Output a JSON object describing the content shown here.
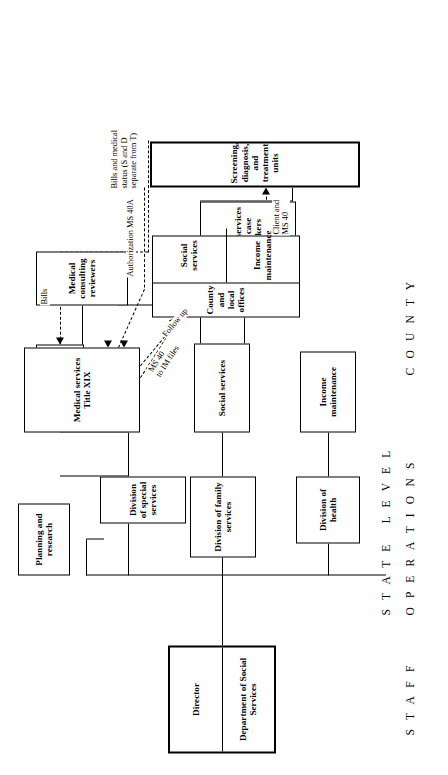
{
  "diagram": {
    "swimlanes": [
      {
        "id": "staff",
        "label": "S T A F F"
      },
      {
        "id": "operations",
        "label": "O P E R A T I O N S"
      },
      {
        "id": "state_level",
        "label": "S T A T E   L E V E L"
      },
      {
        "id": "county",
        "label": "C O U N T Y"
      }
    ],
    "boxes": [
      {
        "id": "director",
        "lines": [
          "Director",
          "Department of Social Services"
        ]
      },
      {
        "id": "planning",
        "lines": [
          "Planning and research"
        ]
      },
      {
        "id": "finance",
        "lines": [
          "Finance"
        ]
      },
      {
        "id": "div_special",
        "lines": [
          "Division of special services"
        ]
      },
      {
        "id": "div_family",
        "lines": [
          "Division of family services"
        ]
      },
      {
        "id": "div_health",
        "lines": [
          "Division of health"
        ]
      },
      {
        "id": "medical_title19",
        "lines": [
          "Medical services Title XIX"
        ]
      },
      {
        "id": "medical_reviewers",
        "lines": [
          "Medical consulting reviewers"
        ]
      },
      {
        "id": "social_services",
        "lines": [
          "Social services"
        ]
      },
      {
        "id": "income_maintenance",
        "lines": [
          "Income maintenance"
        ]
      },
      {
        "id": "county_case_workers",
        "lines": [
          "County and local",
          "Social services unit case workers"
        ]
      },
      {
        "id": "county_local_offices",
        "lines": [
          "County and local offices",
          "Social services",
          "Income maintenance"
        ]
      },
      {
        "id": "sdt_units",
        "lines": [
          "Screening, diagnosis, and treatment units"
        ]
      }
    ],
    "box_text": {
      "director_title": "Director",
      "director_dept": "Department of Social Services",
      "planning": "Planning and research",
      "finance": "Finance",
      "div_special": "Division of special services",
      "div_family": "Division of family services",
      "div_health": "Division of health",
      "medical_title19": "Medical services Title XIX",
      "medical_reviewers": "Medical consulting reviewers",
      "social_services": "Social services",
      "income_maintenance": "Income maintenance",
      "county_case_header": "County and local",
      "county_case_unit": "Social services unit case workers",
      "county_offices_header": "County and local offices",
      "county_offices_social": "Social services",
      "county_offices_income": "Income maintenance",
      "sdt_units": "Screening, diagnosis, and treatment units"
    },
    "flow_labels": {
      "bills": "Bills",
      "follow_up": "Follow up",
      "ms40_to_im": "MS 40\nto IM files",
      "client_ms40": "Client and\nMS 40",
      "authorization": "Authorization MS 40A",
      "bills_status": "Bills and medical\nstatus (S and D\nseparate from T)"
    },
    "colors": {
      "line": "#000000",
      "box_border": "#000000",
      "background": "#ffffff",
      "text": "#000000"
    }
  }
}
